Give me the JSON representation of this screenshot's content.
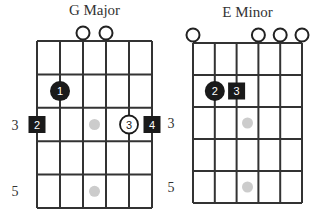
{
  "colors": {
    "grid": "#333333",
    "finger_fill": "#1a1a1a",
    "finger_text": "#ffffff",
    "open_stroke": "#222222",
    "inlay": "#cccccc",
    "background": "#ffffff"
  },
  "chords": [
    {
      "name": "G Major",
      "origin_x": 37,
      "origin_y": 41,
      "string_spacing": 23,
      "fret_spacing": 33.4,
      "num_strings": 6,
      "num_frets": 5,
      "fret_labels": [
        {
          "fret": 3,
          "label": "3"
        },
        {
          "fret": 5,
          "label": "5"
        }
      ],
      "open_strings": [
        3,
        4
      ],
      "inlays": [
        {
          "string_gap": 2.5,
          "fret": 3
        },
        {
          "string_gap": 2.5,
          "fret": 5
        }
      ],
      "fingers": [
        {
          "string": 2,
          "fret": 2,
          "label": "1",
          "shape": "circle",
          "style": "filled"
        },
        {
          "string": 1,
          "fret": 3,
          "label": "2",
          "shape": "square",
          "style": "filled"
        },
        {
          "string": 5,
          "fret": 3,
          "label": "3",
          "shape": "circle",
          "style": "outline"
        },
        {
          "string": 6,
          "fret": 3,
          "label": "4",
          "shape": "square",
          "style": "filled"
        }
      ]
    },
    {
      "name": "E Minor",
      "origin_x": 193,
      "origin_y": 43,
      "string_spacing": 21.8,
      "fret_spacing": 32,
      "num_strings": 6,
      "num_frets": 5,
      "fret_labels": [
        {
          "fret": 3,
          "label": "3"
        },
        {
          "fret": 5,
          "label": "5"
        }
      ],
      "open_strings": [
        1,
        4,
        5,
        6
      ],
      "inlays": [
        {
          "string_gap": 2.5,
          "fret": 3
        },
        {
          "string_gap": 2.5,
          "fret": 5
        }
      ],
      "fingers": [
        {
          "string": 2,
          "fret": 2,
          "label": "2",
          "shape": "circle",
          "style": "filled"
        },
        {
          "string": 3,
          "fret": 2,
          "label": "3",
          "shape": "square",
          "style": "filled"
        }
      ]
    }
  ]
}
